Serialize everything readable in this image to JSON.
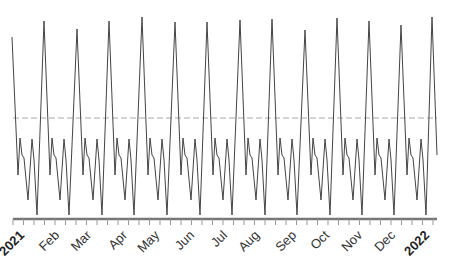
{
  "chart_data": {
    "type": "line",
    "title": "",
    "xlabel": "",
    "ylabel": "",
    "grid": false,
    "legend": null,
    "x_tick_labels": [
      "2021",
      "Feb",
      "Mar",
      "Apr",
      "May",
      "Jun",
      "Jul",
      "Aug",
      "Sep",
      "Oct",
      "Nov",
      "Dec",
      "2022"
    ],
    "x_tick_bold": [
      true,
      false,
      false,
      false,
      false,
      false,
      false,
      false,
      false,
      false,
      false,
      false,
      true
    ],
    "reference_line": {
      "style": "dashed",
      "color": "#aaaaaa",
      "y_px": 118
    },
    "series": [
      {
        "name": "value",
        "color": "#444444",
        "peak_x_px": [
          12,
          44,
          77,
          109,
          142,
          175,
          207,
          240,
          272,
          305,
          337,
          369,
          401,
          432
        ],
        "peak_y_px": [
          37,
          21,
          29,
          21,
          17,
          22,
          22,
          20,
          19,
          30,
          18,
          21,
          25,
          17
        ],
        "cycle_pattern_offsets": [
          [
            6,
            175
          ],
          [
            8,
            138
          ],
          [
            10,
            155
          ],
          [
            12,
            158
          ],
          [
            16,
            200
          ],
          [
            20,
            139
          ],
          [
            22,
            160
          ],
          [
            25,
            215
          ]
        ],
        "end_point": [
          437,
          155
        ]
      }
    ],
    "axis": {
      "x_start_px": 13,
      "x_end_px": 437,
      "y_px": 219,
      "tick_spacing_px": 10.5
    }
  }
}
